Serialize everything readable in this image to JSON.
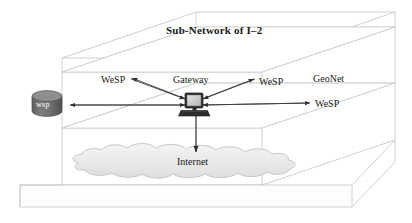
{
  "diagram": {
    "title": "Sub-Network of I–2",
    "type": "network-architecture-3d-box",
    "colors": {
      "box_edge": "#b9b9b9",
      "box_fill": "#ffffff",
      "cloud_fill": "#ececeb",
      "cloud_edge": "#c6c6c6",
      "cylinder_fill": "#6f6f6f",
      "cylinder_top": "#8c8c8c",
      "monitor_body": "#3a3a3a",
      "monitor_screen": "#cfcfcf",
      "line": "#3c3c3c",
      "text": "#1a1a1a",
      "text_inverse": "#ffffff",
      "background": "#ffffff"
    },
    "nodes": {
      "gateway": {
        "label": "Gateway",
        "icon": "computer-monitor-icon",
        "x": 193,
        "y": 103
      },
      "wsp_store": {
        "label": "wsp",
        "icon": "database-cylinder-icon",
        "x": 47,
        "y": 105
      },
      "internet": {
        "label": "Internet",
        "icon": "cloud-icon",
        "x": 196,
        "y": 162
      }
    },
    "labels": {
      "wesp_left": "WeSP",
      "wesp_right": "WeSP",
      "wesp_far_right": "WeSP",
      "geonet": "GeoNet"
    },
    "layers": [
      {
        "name": "top-layer",
        "contents": "Sub-Network of I–2"
      },
      {
        "name": "middle-layer",
        "contents": "GeoNet gateway plane"
      },
      {
        "name": "bottom-layer",
        "contents": "Internet cloud plane"
      },
      {
        "name": "base-slab",
        "contents": ""
      }
    ],
    "connections": [
      {
        "from": "wesp-left",
        "to": "gateway",
        "direction": "bidirectional"
      },
      {
        "from": "wsp_store",
        "to": "gateway",
        "direction": "bidirectional"
      },
      {
        "from": "gateway",
        "to": "wesp-right",
        "direction": "bidirectional"
      },
      {
        "from": "gateway",
        "to": "wesp-far-right",
        "direction": "bidirectional"
      },
      {
        "from": "gateway",
        "to": "internet",
        "direction": "down"
      }
    ]
  }
}
